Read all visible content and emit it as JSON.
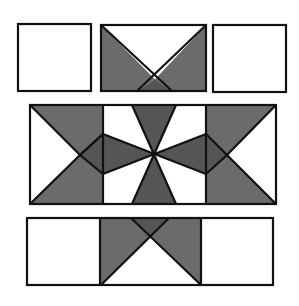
{
  "colors": {
    "fill_dark": "#6b6b6b",
    "fill_darker": "#555555",
    "fill_light": "#ffffff",
    "outline": "#111111"
  },
  "pieces": {
    "top_row": [
      "plain-square",
      "hourglass-piece",
      "plain-square"
    ],
    "middle_band": [
      "half-star-left",
      "pinwheel-center",
      "half-star-right"
    ],
    "bottom_row": [
      "plain-square",
      "hourglass-piece",
      "plain-square"
    ]
  }
}
